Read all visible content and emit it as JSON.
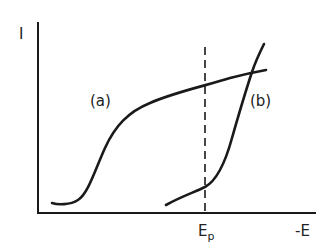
{
  "diagram": {
    "y_axis_label": "I",
    "x_axis_label": "-E",
    "marker_label": "E",
    "marker_subscript": "p",
    "curves": [
      {
        "id": "a",
        "label": "(a)"
      },
      {
        "id": "b",
        "label": "(b)"
      }
    ],
    "colors": {
      "line": "#1a1a1a",
      "background": "#ffffff"
    }
  }
}
